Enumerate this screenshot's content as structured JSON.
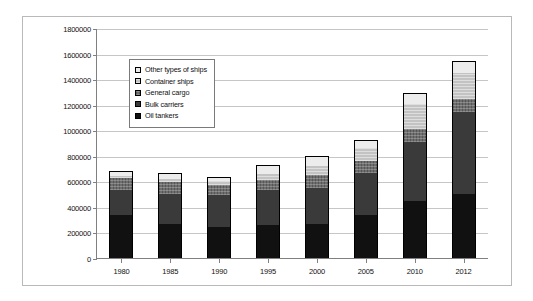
{
  "chart_data": {
    "type": "bar",
    "title": "",
    "subtitle": "",
    "stacked": true,
    "xlabel": "",
    "ylabel": "",
    "grid": true,
    "legend_position": "inside-top-left",
    "categories": [
      "1980",
      "1985",
      "1990",
      "1995",
      "2000",
      "2005",
      "2010",
      "2012"
    ],
    "ylim": [
      0,
      1800000
    ],
    "ytick_interval": 200000,
    "ytick_labels": [
      "0",
      "200000",
      "400000",
      "600000",
      "800000",
      "1000000",
      "1200000",
      "1400000",
      "1600000",
      "1800000"
    ],
    "series": [
      {
        "name": "Oil tankers",
        "color": "#111111",
        "values": [
          340000,
          265000,
          245000,
          260000,
          270000,
          340000,
          450000,
          500000
        ]
      },
      {
        "name": "Bulk carriers",
        "color": "#3a3a3a",
        "values": [
          195000,
          235000,
          245000,
          275000,
          280000,
          325000,
          455000,
          640000
        ]
      },
      {
        "name": "General cargo",
        "color": "#6e6e6e",
        "values": [
          95000,
          95000,
          80000,
          75000,
          100000,
          95000,
          105000,
          105000
        ]
      },
      {
        "name": "Container ships",
        "color": "#c3c3c3",
        "values": [
          15000,
          25000,
          30000,
          45000,
          70000,
          100000,
          195000,
          200000
        ]
      },
      {
        "name": "Other types of ships",
        "color": "#ececec",
        "values": [
          25000,
          35000,
          30000,
          65000,
          70000,
          55000,
          75000,
          90000
        ]
      }
    ],
    "totals": [
      670000,
      655000,
      630000,
      720000,
      790000,
      915000,
      1280000,
      1535000
    ]
  },
  "legend": {
    "items": [
      {
        "label": "Other types of ships",
        "swatch": "white-swatch"
      },
      {
        "label": "Container ships",
        "swatch": "light-gray-swatch"
      },
      {
        "label": "General cargo",
        "swatch": "medium-gray-swatch"
      },
      {
        "label": "Bulk carriers",
        "swatch": "dark-gray-swatch"
      },
      {
        "label": "Oil tankers",
        "swatch": "black-swatch"
      }
    ]
  }
}
